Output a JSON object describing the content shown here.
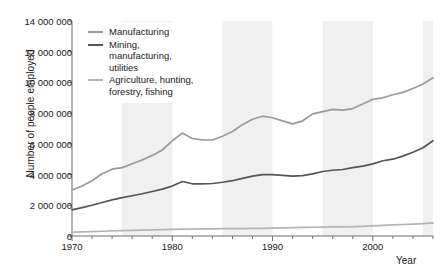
{
  "chart_data": {
    "type": "line",
    "title": "",
    "xlabel": "Year",
    "ylabel": "Number of people employed",
    "xlim": [
      1970,
      2006
    ],
    "ylim": [
      0,
      14000000
    ],
    "grid": false,
    "legend_position": "top-left-inside",
    "x_ticks_major": [
      1970,
      1980,
      1990,
      2000
    ],
    "x_ticks_minor_step": 2,
    "y_ticks": [
      0,
      2000000,
      4000000,
      6000000,
      8000000,
      10000000,
      12000000,
      14000000
    ],
    "y_tick_labels": [
      "0",
      "2 000 000",
      "4 000 000",
      "6 000 000",
      "8 000 000",
      "10 000 000",
      "12 000 000",
      "14 000 000"
    ],
    "x": [
      1970,
      1971,
      1972,
      1973,
      1974,
      1975,
      1976,
      1977,
      1978,
      1979,
      1980,
      1981,
      1982,
      1983,
      1984,
      1985,
      1986,
      1987,
      1988,
      1989,
      1990,
      1991,
      1992,
      1993,
      1994,
      1995,
      1996,
      1997,
      1998,
      1999,
      2000,
      2001,
      2002,
      2003,
      2004,
      2005,
      2006
    ],
    "series": [
      {
        "name": "Manufacturing",
        "color": "#9a9a9a",
        "values": [
          3000000,
          3250000,
          3600000,
          4050000,
          4350000,
          4450000,
          4700000,
          4950000,
          5250000,
          5600000,
          6200000,
          6700000,
          6350000,
          6250000,
          6250000,
          6500000,
          6800000,
          7250000,
          7600000,
          7800000,
          7700000,
          7500000,
          7300000,
          7500000,
          7950000,
          8100000,
          8250000,
          8200000,
          8300000,
          8600000,
          8900000,
          9000000,
          9200000,
          9350000,
          9600000,
          9900000,
          10300000
        ]
      },
      {
        "name": "Mining,\nmanufacturing,\nutilities",
        "color": "#555555",
        "values": [
          1700000,
          1850000,
          2000000,
          2180000,
          2350000,
          2500000,
          2620000,
          2750000,
          2900000,
          3050000,
          3250000,
          3550000,
          3400000,
          3400000,
          3420000,
          3500000,
          3600000,
          3750000,
          3900000,
          4000000,
          4000000,
          3950000,
          3900000,
          3930000,
          4050000,
          4200000,
          4280000,
          4330000,
          4450000,
          4550000,
          4700000,
          4900000,
          5000000,
          5200000,
          5450000,
          5750000,
          6200000
        ]
      },
      {
        "name": "Agriculture, hunting,\nforestry, fishing",
        "color": "#b4b4b4",
        "values": [
          250000,
          270000,
          290000,
          310000,
          330000,
          350000,
          370000,
          385000,
          400000,
          415000,
          430000,
          445000,
          455000,
          465000,
          470000,
          475000,
          478000,
          480000,
          490000,
          500000,
          515000,
          530000,
          545000,
          560000,
          570000,
          580000,
          590000,
          600000,
          605000,
          625000,
          655000,
          690000,
          720000,
          750000,
          775000,
          810000,
          850000
        ]
      }
    ]
  },
  "axis": {
    "y_title": "Number of people employed",
    "x_title": "Year"
  },
  "legend": {
    "items": [
      {
        "label": "Manufacturing"
      },
      {
        "label": "Mining,\nmanufacturing,\nutilities"
      },
      {
        "label": "Agriculture, hunting,\nforestry, fishing"
      }
    ]
  },
  "colors": {
    "band_light": "#ffffff",
    "band_shade": "#f0f0f0",
    "axis": "#6f6f6f",
    "text": "#1a1a1a"
  }
}
